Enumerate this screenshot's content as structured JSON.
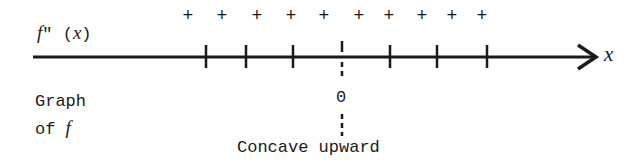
{
  "diagram": {
    "type": "sign-chart",
    "function_label": "f\" (x)",
    "axis_label": "x",
    "sign_row": [
      "+",
      "+",
      "+",
      "+",
      "+",
      "+",
      "+",
      "+",
      "+",
      "+"
    ],
    "plus_x": [
      188,
      222,
      257,
      291,
      324,
      359,
      389,
      422,
      452,
      482
    ],
    "tick_x": [
      206,
      246,
      293,
      342,
      390,
      437,
      487
    ],
    "zero_marker": {
      "label": "0",
      "x": 342
    },
    "graph_label_line1": "Graph",
    "graph_label_line2_prefix": "of ",
    "graph_label_line2_var": "f",
    "conclusion": "Concave upward",
    "colors": {
      "ink": "#1a1a1a",
      "background": "#ffffff"
    }
  }
}
